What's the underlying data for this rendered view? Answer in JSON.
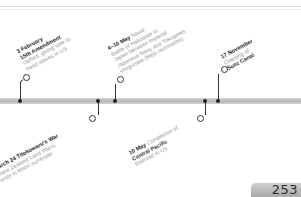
{
  "page": {
    "number": "253"
  },
  "events_above": [
    {
      "date": "3 February",
      "title": "15th Amendment",
      "lines": [
        "ratified, giving vote to",
        "freed slaves in US"
      ]
    },
    {
      "date": "4–10 May",
      "title": "Naval",
      "lines": [
        "Battle of Hakodate in",
        "Japan between Imperial",
        "Japanese Navy and Tokugawa",
        "shogunate (Meiji restoration)"
      ]
    },
    {
      "date": "17 November",
      "title": "",
      "lines": [
        "Opening of",
        "Suez Canal"
      ]
    }
  ],
  "events_below": [
    {
      "date": "March 24",
      "title": "Titokowaru's War",
      "lines": [
        "(New Zealand Land Wars)",
        "ends in Maori surrender"
      ]
    },
    {
      "date": "10 May",
      "title": "Completion of",
      "lines": [
        "Central Pacific",
        "Railroad in US"
      ]
    }
  ]
}
